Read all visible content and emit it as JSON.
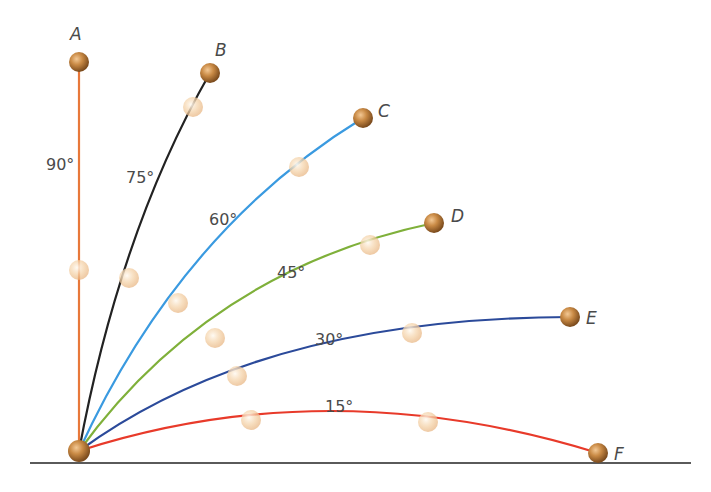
{
  "diagram": {
    "title": "",
    "origin": {
      "x": 79,
      "y": 451
    },
    "ground": {
      "x1": 30,
      "x2": 691,
      "y": 463,
      "color": "#5a5a5a"
    },
    "trajectories": [
      {
        "id": "A",
        "angle_label": "90°",
        "color": "#e8783a",
        "end_label": "A",
        "path": "M79,451 L79,62",
        "end": {
          "x": 79,
          "y": 62
        },
        "ghosts": [
          {
            "x": 79,
            "y": 270
          }
        ],
        "label_pos": {
          "x": 46,
          "y": 170
        },
        "end_label_pos": {
          "x": 70,
          "y": 40
        }
      },
      {
        "id": "B",
        "angle_label": "75°",
        "color": "#222222",
        "end_label": "B",
        "path": "M79,451 Q120,230 210,73",
        "end": {
          "x": 210,
          "y": 73
        },
        "ghosts": [
          {
            "x": 129,
            "y": 278
          },
          {
            "x": 193,
            "y": 107
          }
        ],
        "label_pos": {
          "x": 126,
          "y": 183
        },
        "end_label_pos": {
          "x": 215,
          "y": 56
        }
      },
      {
        "id": "C",
        "angle_label": "60°",
        "color": "#3a9ae0",
        "end_label": "C",
        "path": "M79,451 Q180,230 363,118",
        "end": {
          "x": 363,
          "y": 118
        },
        "ghosts": [
          {
            "x": 178,
            "y": 303
          },
          {
            "x": 299,
            "y": 167
          }
        ],
        "label_pos": {
          "x": 209,
          "y": 225
        },
        "end_label_pos": {
          "x": 378,
          "y": 117
        }
      },
      {
        "id": "D",
        "angle_label": "45°",
        "color": "#7fb03a",
        "end_label": "D",
        "path": "M79,451 Q210,270 434,223",
        "end": {
          "x": 434,
          "y": 223
        },
        "ghosts": [
          {
            "x": 215,
            "y": 338
          },
          {
            "x": 370,
            "y": 245
          }
        ],
        "label_pos": {
          "x": 277,
          "y": 278
        },
        "end_label_pos": {
          "x": 451,
          "y": 222
        }
      },
      {
        "id": "E",
        "angle_label": "30°",
        "color": "#2b4a9a",
        "end_label": "E",
        "path": "M79,451 Q260,318 570,317",
        "end": {
          "x": 570,
          "y": 317
        },
        "ghosts": [
          {
            "x": 237,
            "y": 376
          },
          {
            "x": 412,
            "y": 333
          }
        ],
        "label_pos": {
          "x": 315,
          "y": 345
        },
        "end_label_pos": {
          "x": 586,
          "y": 324
        }
      },
      {
        "id": "F",
        "angle_label": "15°",
        "color": "#e83a2a",
        "end_label": "F",
        "path": "M79,451 Q330,370 598,453",
        "end": {
          "x": 598,
          "y": 453
        },
        "ghosts": [
          {
            "x": 251,
            "y": 420
          },
          {
            "x": 428,
            "y": 422
          }
        ],
        "label_pos": {
          "x": 325,
          "y": 412
        },
        "end_label_pos": {
          "x": 614,
          "y": 460
        }
      }
    ]
  }
}
